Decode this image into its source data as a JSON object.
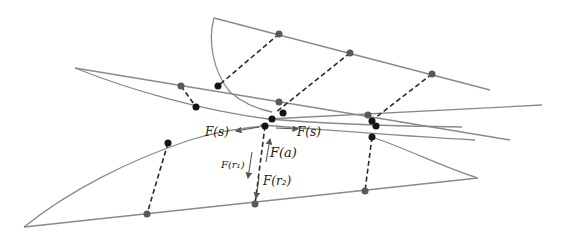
{
  "diagram": {
    "type": "spring-mass sheet linkage",
    "colors": {
      "sheet_line": "#8a8a8a",
      "link": "#2a2a2a",
      "node_dark": "#141414",
      "node_grey": "#5a5a5a"
    },
    "labels": {
      "force_s_left": "F(s)",
      "force_s_right": "F(s)",
      "force_a": "F(a)",
      "force_r1": "F(r₁)",
      "force_r2": "F(r₂)"
    }
  }
}
